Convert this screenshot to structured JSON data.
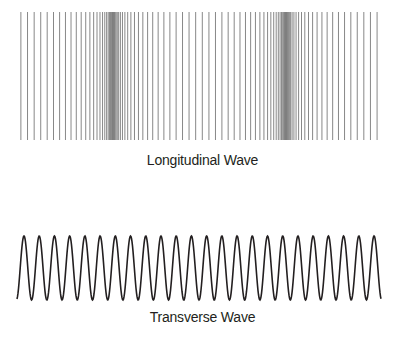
{
  "diagrams": {
    "longitudinal": {
      "caption": "Longitudinal Wave",
      "line_color": "#7a7a7a",
      "y_top": 12,
      "y_bottom": 140,
      "x_start": 18,
      "x_end": 380,
      "line_spacing": 3.55,
      "wavelength": 173,
      "compression_centers": [
        113,
        286
      ],
      "displacement_amplitude": 24
    },
    "transverse": {
      "caption": "Transverse Wave",
      "stroke_color": "#231f20",
      "x_start": 17,
      "x_end": 381,
      "y_peak": 236,
      "y_trough": 300,
      "first_peak_x": 24,
      "period": 15.22,
      "peak_count": 24
    }
  }
}
